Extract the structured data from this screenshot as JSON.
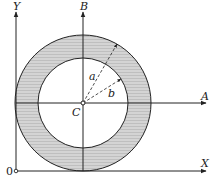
{
  "diagram": {
    "title": "",
    "origin_label": "0",
    "axes": {
      "x_label": "X",
      "y_label": "Y",
      "a_label": "A",
      "b_label": "B"
    },
    "center_label": "C",
    "radii": {
      "outer_label": "a",
      "inner_label": "b"
    },
    "colors": {
      "ring_fill": "#c8c8c8",
      "line": "#222222",
      "background": "#ffffff"
    }
  }
}
